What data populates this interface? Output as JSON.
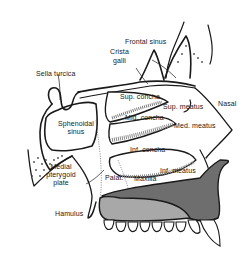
{
  "diagram": {
    "colors": {
      "outline": "#1a1a1a",
      "hard_palate_dark": "#6e6e6e",
      "palate_light": "#a8a8a8",
      "concha_shading": "#8a8a8a",
      "background": "#ffffff"
    },
    "labels": {
      "frontal_sinus": "Frontal sinus",
      "crista_galli_1": "Crista",
      "crista_galli_2": "galli",
      "sella_turcica": "Sella turcica",
      "sphenoidal_sinus_1": "Sphenoidal",
      "sphenoidal_sinus_2": "sinus",
      "sup_concha": "Sup. concha",
      "sup_meatus": "Sup. meatus",
      "nasal": "Nasal",
      "mid_concha": "Mid. concha",
      "med_meatus": "Med. meatus",
      "inf_concha": "Inf. concha",
      "inf_meatus": "Inf. meatus",
      "medial_pterygoid_1": "Medial",
      "medial_pterygoid_2": "pterygoid",
      "medial_pterygoid_3": "plate",
      "palat": "Palat.",
      "maxilla": "Maxilla",
      "hamulus": "Hamulus"
    }
  }
}
